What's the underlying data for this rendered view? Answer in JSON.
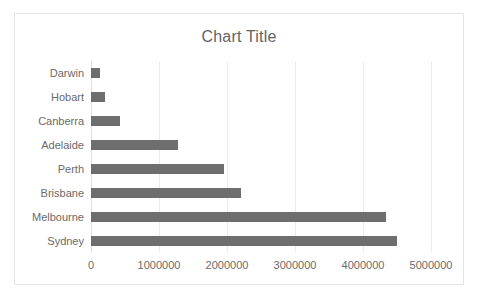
{
  "chart_data": {
    "type": "bar",
    "orientation": "horizontal",
    "title": "Chart Title",
    "xlabel": "",
    "ylabel": "",
    "categories": [
      "Darwin",
      "Hobart",
      "Canberra",
      "Adelaide",
      "Perth",
      "Brisbane",
      "Melbourne",
      "Sydney"
    ],
    "values": [
      130000,
      210000,
      430000,
      1280000,
      1950000,
      2200000,
      4340000,
      4500000
    ],
    "xlim": [
      0,
      5000000
    ],
    "xticks": [
      0,
      1000000,
      2000000,
      3000000,
      4000000,
      5000000
    ],
    "xtick_labels": [
      "0",
      "1000000",
      "2000000",
      "3000000",
      "4000000",
      "5000000"
    ],
    "grid": true,
    "grid_axis": "x",
    "legend": false,
    "series": [
      {
        "name": "Series 1",
        "values": [
          130000,
          210000,
          430000,
          1280000,
          1950000,
          2200000,
          4340000,
          4500000
        ]
      }
    ]
  },
  "style": {
    "bar_color": "#6e6e6e",
    "gridline_color": "#ededed",
    "text_color": "#6a6a6a",
    "title_color": "#636363",
    "frame_border_color": "#e4e4e4",
    "plot_background": "#ffffff"
  }
}
